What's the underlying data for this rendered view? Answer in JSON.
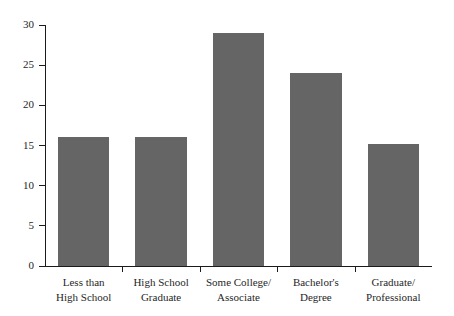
{
  "chart_data": {
    "type": "bar",
    "title": "",
    "subtitle": "",
    "xlabel": "",
    "ylabel": "",
    "categories": [
      "Less than High School",
      "High School Graduate",
      "Some College/ Associate",
      "Bachelor's Degree",
      "Graduate/ Professional"
    ],
    "category_lines": [
      [
        "Less than",
        "High School"
      ],
      [
        "High School",
        "Graduate"
      ],
      [
        "Some College/",
        "Associate"
      ],
      [
        "Bachelor's",
        "Degree"
      ],
      [
        "Graduate/",
        "Professional"
      ]
    ],
    "values": [
      16,
      16,
      29,
      24,
      15.2
    ],
    "ylim": [
      0,
      30
    ],
    "ytick_labels": [
      "0",
      "5",
      "10",
      "15",
      "20",
      "25",
      "30"
    ],
    "ytick_values": [
      0,
      5,
      10,
      15,
      20,
      25,
      30
    ],
    "grid": false,
    "legend": null,
    "legend_position": "none",
    "bar_color": "#656565",
    "axis_color": "#1b1b1b",
    "text_color": "#1f1f1f",
    "background_color": "#ffffff"
  }
}
